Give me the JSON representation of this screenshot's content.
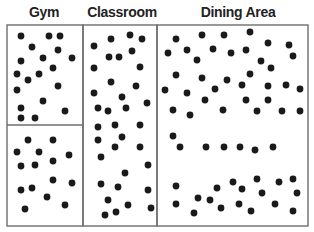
{
  "colors": {
    "border": "#6e6e6e",
    "dot": "#1a1a1a",
    "text": "#222222"
  },
  "regions": [
    {
      "name": "gym",
      "label": "Gym",
      "label_x": 44,
      "x": 7,
      "y": 25,
      "w": 76,
      "h": 201
    },
    {
      "name": "classroom",
      "label": "Classroom",
      "label_x": 122,
      "x": 83,
      "y": 25,
      "w": 74,
      "h": 201
    },
    {
      "name": "dining-area",
      "label": "Dining Area",
      "label_x": 238,
      "x": 157,
      "y": 25,
      "w": 151,
      "h": 201
    }
  ],
  "gym_divider_y": 125,
  "dots": {
    "gym_top": [
      [
        21,
        36
      ],
      [
        49,
        36
      ],
      [
        60,
        36
      ],
      [
        32,
        47
      ],
      [
        58,
        50
      ],
      [
        21,
        61
      ],
      [
        43,
        58
      ],
      [
        72,
        58
      ],
      [
        17,
        74
      ],
      [
        28,
        80
      ],
      [
        39,
        74
      ],
      [
        53,
        68
      ],
      [
        17,
        90
      ],
      [
        58,
        86
      ],
      [
        43,
        101
      ],
      [
        21,
        108
      ],
      [
        65,
        111
      ],
      [
        21,
        118
      ],
      [
        35,
        118
      ]
    ],
    "gym_bottom": [
      [
        28,
        140
      ],
      [
        53,
        140
      ],
      [
        17,
        152
      ],
      [
        39,
        152
      ],
      [
        69,
        155
      ],
      [
        21,
        166
      ],
      [
        35,
        165
      ],
      [
        53,
        161
      ],
      [
        53,
        180
      ],
      [
        72,
        183
      ],
      [
        21,
        190
      ],
      [
        32,
        188
      ],
      [
        47,
        197
      ],
      [
        65,
        205
      ],
      [
        25,
        209
      ]
    ],
    "classroom": [
      [
        94,
        46
      ],
      [
        111,
        39
      ],
      [
        130,
        35
      ],
      [
        142,
        39
      ],
      [
        109,
        57
      ],
      [
        119,
        57
      ],
      [
        132,
        51
      ],
      [
        94,
        68
      ],
      [
        140,
        67
      ],
      [
        111,
        82
      ],
      [
        136,
        86
      ],
      [
        94,
        93
      ],
      [
        122,
        97
      ],
      [
        147,
        103
      ],
      [
        98,
        108
      ],
      [
        108,
        111
      ],
      [
        126,
        108
      ],
      [
        98,
        127
      ],
      [
        115,
        125
      ],
      [
        140,
        125
      ],
      [
        98,
        140
      ],
      [
        122,
        137
      ],
      [
        115,
        147
      ],
      [
        140,
        147
      ],
      [
        101,
        157
      ],
      [
        148,
        165
      ],
      [
        125,
        173
      ],
      [
        101,
        184
      ],
      [
        118,
        187
      ],
      [
        148,
        190
      ],
      [
        108,
        200
      ],
      [
        128,
        205
      ],
      [
        151,
        208
      ],
      [
        105,
        215
      ],
      [
        116,
        212
      ]
    ],
    "dining_area": [
      [
        176,
        39
      ],
      [
        202,
        35
      ],
      [
        224,
        35
      ],
      [
        168,
        53
      ],
      [
        187,
        50
      ],
      [
        213,
        49
      ],
      [
        231,
        53
      ],
      [
        197,
        60
      ],
      [
        176,
        75
      ],
      [
        202,
        78
      ],
      [
        227,
        80
      ],
      [
        165,
        90
      ],
      [
        187,
        93
      ],
      [
        215,
        89
      ],
      [
        205,
        100
      ],
      [
        173,
        110
      ],
      [
        190,
        115
      ],
      [
        223,
        110
      ],
      [
        250,
        32
      ],
      [
        268,
        43
      ],
      [
        289,
        45
      ],
      [
        246,
        50
      ],
      [
        293,
        56
      ],
      [
        261,
        61
      ],
      [
        271,
        68
      ],
      [
        250,
        74
      ],
      [
        242,
        85
      ],
      [
        268,
        86
      ],
      [
        286,
        85
      ],
      [
        300,
        89
      ],
      [
        246,
        100
      ],
      [
        268,
        100
      ],
      [
        257,
        111
      ],
      [
        282,
        111
      ],
      [
        300,
        111
      ],
      [
        173,
        136
      ],
      [
        180,
        147
      ],
      [
        206,
        147
      ],
      [
        224,
        147
      ],
      [
        240,
        147
      ],
      [
        255,
        150
      ],
      [
        273,
        147
      ],
      [
        176,
        186
      ],
      [
        217,
        188
      ],
      [
        198,
        198
      ],
      [
        210,
        200
      ],
      [
        233,
        182
      ],
      [
        176,
        204
      ],
      [
        194,
        213
      ],
      [
        221,
        208
      ],
      [
        257,
        179
      ],
      [
        279,
        182
      ],
      [
        293,
        179
      ],
      [
        242,
        189
      ],
      [
        262,
        193
      ],
      [
        297,
        193
      ],
      [
        239,
        204
      ],
      [
        275,
        204
      ],
      [
        251,
        211
      ],
      [
        293,
        211
      ]
    ]
  },
  "dot_radius": 3.4
}
